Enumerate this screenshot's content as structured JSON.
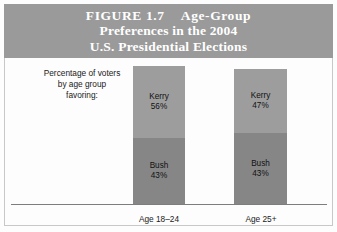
{
  "figure": {
    "title_lines": [
      "FIGURE 1.7",
      "Age-Group",
      "Preferences in the 2004",
      "U.S. Presidential Elections"
    ],
    "caption_lines": [
      "Percentage of voters",
      "by age group",
      "favoring:"
    ],
    "colors": {
      "banner": "#9a9a9a",
      "banner_text": "#ffffff",
      "kerry_segment": "#9d9d9d",
      "bush_segment": "#868686",
      "baseline": "#7d7d7d",
      "body_background": "#fdfdfd",
      "label_text": "#111111"
    }
  },
  "chart_data": {
    "type": "bar",
    "subtype": "stacked",
    "title": "FIGURE 1.7 Age-Group Preferences in the 2004 U.S. Presidential Elections",
    "xlabel": "",
    "ylabel": "",
    "categories": [
      "Age 18–24",
      "Age 25+"
    ],
    "series": [
      {
        "name": "Kerry",
        "values": [
          56,
          47
        ],
        "value_labels": [
          "56%",
          "47%"
        ]
      },
      {
        "name": "Bush",
        "values": [
          43,
          43
        ],
        "value_labels": [
          "43%",
          "43%"
        ]
      }
    ],
    "stack_order_top_to_bottom": [
      "Kerry",
      "Bush"
    ],
    "units": "percent",
    "grid": false,
    "legend": "none",
    "axis_visible": {
      "x": true,
      "y": false
    },
    "bars": [
      {
        "category": "Age 18–24",
        "segments": [
          {
            "name": "Kerry",
            "value": 56,
            "label": "Kerry",
            "value_label": "56%"
          },
          {
            "name": "Bush",
            "value": 43,
            "label": "Bush",
            "value_label": "43%"
          }
        ]
      },
      {
        "category": "Age 25+",
        "segments": [
          {
            "name": "Kerry",
            "value": 47,
            "label": "Kerry",
            "value_label": "47%"
          },
          {
            "name": "Bush",
            "value": 43,
            "label": "Bush",
            "value_label": "43%"
          }
        ]
      }
    ]
  }
}
